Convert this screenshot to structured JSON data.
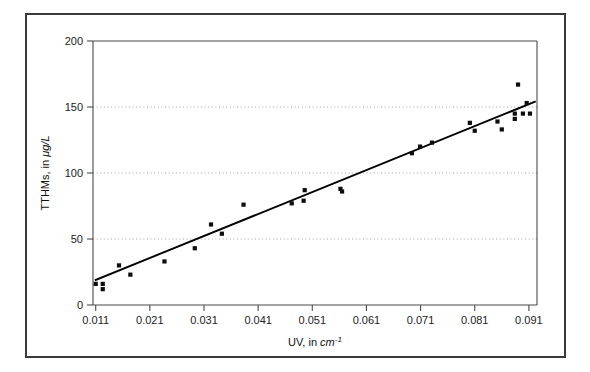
{
  "figure": {
    "background_color": "#ffffff",
    "border_color": "#3a3a3a"
  },
  "chart_data": {
    "type": "scatter",
    "title": "",
    "subtitle": "",
    "xlabel": "UV, in cm⁻¹",
    "xlabel_prefix": "UV, in ",
    "xlabel_unit": "cm",
    "xlabel_exponent": "-1",
    "ylabel": "TTHMs, in μg/L",
    "ylabel_prefix": "TTHMs, in ",
    "ylabel_unit": "μg/L",
    "xlim": [
      0.0105,
      0.0925
    ],
    "ylim": [
      0,
      200
    ],
    "xticks": [
      0.011,
      0.021,
      0.031,
      0.041,
      0.051,
      0.061,
      0.071,
      0.081,
      0.091
    ],
    "xtick_labels": [
      "0.011",
      "0.021",
      "0.031",
      "0.041",
      "0.051",
      "0.061",
      "0.071",
      "0.081",
      "0.091"
    ],
    "yticks": [
      0,
      50,
      100,
      150,
      200
    ],
    "ytick_labels": [
      "0",
      "50",
      "100",
      "150",
      "200"
    ],
    "grid": true,
    "grid_axis": "y",
    "grid_values": [
      50,
      100,
      150
    ],
    "legend": null,
    "legend_position": "none",
    "marker": "square",
    "marker_color": "#0d0d0d",
    "marker_size": 4.2,
    "points": [
      {
        "x": 0.011,
        "y": 16
      },
      {
        "x": 0.0123,
        "y": 12
      },
      {
        "x": 0.0123,
        "y": 16
      },
      {
        "x": 0.0153,
        "y": 30
      },
      {
        "x": 0.0174,
        "y": 23
      },
      {
        "x": 0.0237,
        "y": 33
      },
      {
        "x": 0.0293,
        "y": 43
      },
      {
        "x": 0.0323,
        "y": 61
      },
      {
        "x": 0.0343,
        "y": 54
      },
      {
        "x": 0.0383,
        "y": 76
      },
      {
        "x": 0.0472,
        "y": 77
      },
      {
        "x": 0.0494,
        "y": 79
      },
      {
        "x": 0.0496,
        "y": 87
      },
      {
        "x": 0.0562,
        "y": 88
      },
      {
        "x": 0.0565,
        "y": 86
      },
      {
        "x": 0.0694,
        "y": 115
      },
      {
        "x": 0.0709,
        "y": 120
      },
      {
        "x": 0.0731,
        "y": 123
      },
      {
        "x": 0.0801,
        "y": 138
      },
      {
        "x": 0.081,
        "y": 132
      },
      {
        "x": 0.0852,
        "y": 139
      },
      {
        "x": 0.086,
        "y": 133
      },
      {
        "x": 0.0884,
        "y": 145
      },
      {
        "x": 0.0884,
        "y": 141
      },
      {
        "x": 0.089,
        "y": 167
      },
      {
        "x": 0.0899,
        "y": 145
      },
      {
        "x": 0.0906,
        "y": 153
      },
      {
        "x": 0.0912,
        "y": 145
      }
    ],
    "fit_line": {
      "type": "linear-regression",
      "x_start": 0.011,
      "y_start": 19,
      "x_end": 0.0921,
      "y_end": 154
    }
  }
}
